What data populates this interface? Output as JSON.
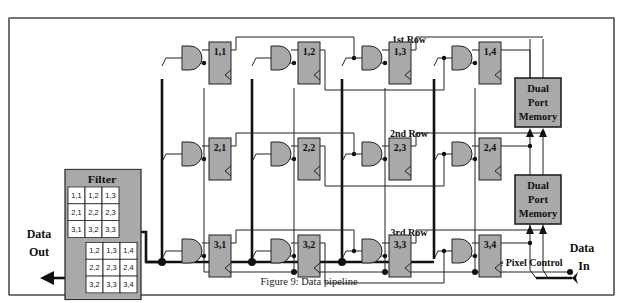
{
  "figure": {
    "caption": "Figure 9: Data pipeline",
    "row_labels": [
      "1st Row",
      "2nd Row",
      "3rd Row"
    ],
    "data_out": [
      "Data",
      "Out"
    ],
    "data_in": [
      "Data",
      "In"
    ],
    "edge_pixel_control": "Edge Pixel Control",
    "memory_label": [
      "Dual",
      "Port",
      "Memory"
    ],
    "filter": {
      "title": "Filter",
      "grid_top": [
        [
          "1,1",
          "1,2",
          "1,3"
        ],
        [
          "2,1",
          "2,2",
          "2,3"
        ],
        [
          "3,1",
          "3,2",
          "3,3"
        ]
      ],
      "grid_bottom": [
        [
          "1,2",
          "1,3",
          "1,4"
        ],
        [
          "2,2",
          "2,3",
          "2,4"
        ],
        [
          "3,2",
          "3,3",
          "3,4"
        ]
      ]
    },
    "registers": [
      [
        "1,1",
        "1,2",
        "1,3",
        "1,4"
      ],
      [
        "2,1",
        "2,2",
        "2,3",
        "2,4"
      ],
      [
        "3,1",
        "3,2",
        "3,3",
        "3,4"
      ]
    ],
    "colors": {
      "block_fill": "#a9a9a9",
      "line": "#222222",
      "frame": "#555555"
    }
  }
}
